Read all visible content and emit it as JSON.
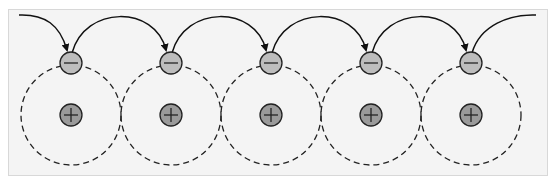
{
  "diagram": {
    "atom_count": 5,
    "atoms": [
      {
        "cx": 71,
        "label": "+"
      },
      {
        "cx": 171,
        "label": "+"
      },
      {
        "cx": 271,
        "label": "+"
      },
      {
        "cx": 371,
        "label": "+"
      },
      {
        "cx": 471,
        "label": "+"
      }
    ],
    "electron_label": "−",
    "colors": {
      "background": "#f4f4f4",
      "nucleus_fill": "#9a9a9a",
      "electron_fill": "#bdbdbd",
      "stroke": "#222222"
    }
  }
}
